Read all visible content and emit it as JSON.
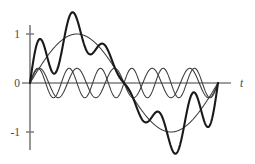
{
  "chart_data": {
    "type": "line",
    "title": "",
    "subtitle": "",
    "xlabel": "t",
    "ylabel": "",
    "grid": false,
    "legend": "none",
    "xlim": [
      0,
      1
    ],
    "ylim": [
      -1.55,
      1.6
    ],
    "x_axis": {
      "label": "t",
      "ticks": [],
      "tick_labels": [],
      "shown": true
    },
    "y_axis": {
      "ticks": [
        1,
        0,
        -1
      ],
      "tick_labels": [
        "1",
        "0",
        "-1"
      ],
      "shown": true
    },
    "annotations": [],
    "series": [
      {
        "name": "fundamental",
        "role": "fundamental sine, one full period",
        "style": "thin",
        "amplitude": 1.0,
        "harmonic": 1,
        "phase": 0,
        "color": "#3b3b3b",
        "linewidth": 1.05
      },
      {
        "name": "harmonic-5",
        "role": "fifth harmonic, small amplitude",
        "style": "thin",
        "amplitude": 0.3,
        "harmonic": 5,
        "phase": 0,
        "color": "#3b3b3b",
        "linewidth": 1.05
      },
      {
        "name": "harmonic-6",
        "role": "sixth harmonic, small amplitude",
        "style": "thin",
        "amplitude": 0.3,
        "harmonic": 6,
        "phase": 0,
        "color": "#3b3b3b",
        "linewidth": 1.05
      },
      {
        "name": "sum",
        "role": "sum of fundamental and harmonics",
        "style": "bold",
        "components": [
          {
            "amplitude": 1.0,
            "harmonic": 1,
            "phase": 0
          },
          {
            "amplitude": 0.3,
            "harmonic": 5,
            "phase": 0
          },
          {
            "amplitude": 0.3,
            "harmonic": 6,
            "phase": 0
          }
        ],
        "peak_value": 1.5,
        "trough_value": -1.27,
        "color": "#1a1a1a",
        "linewidth": 2.1
      }
    ]
  },
  "geometry": {
    "origin_x": 30,
    "origin_y": 83,
    "x_end": 231,
    "curve_start_x": 30,
    "curve_end_x": 218,
    "y_axis_top": 25,
    "y_axis_bottom": 150,
    "unit_y": 49,
    "tick_half_width": 4,
    "t_label_x": 240,
    "t_label_y": 87
  },
  "colors": {
    "background": "#ffffff",
    "axis": "#7d7d7d",
    "thin_curve": "#3b3b3b",
    "bold_curve": "#1a1a1a",
    "label": "#4a4a4a"
  }
}
